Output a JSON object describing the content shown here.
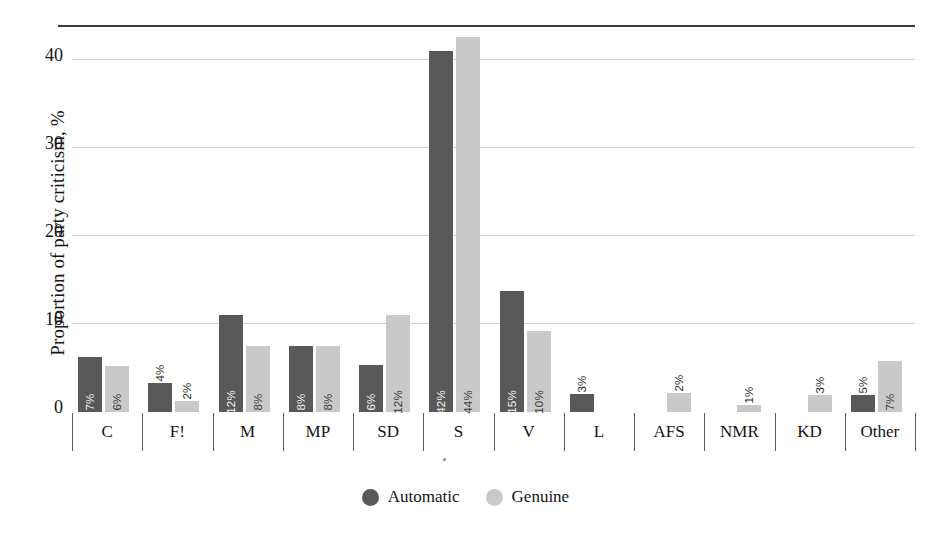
{
  "chart_data": {
    "type": "bar",
    "title": "",
    "xlabel": "",
    "ylabel": "Proportion of party criticism, %",
    "ylim": [
      0,
      44
    ],
    "yticks": [
      0,
      10,
      20,
      30,
      40
    ],
    "ytick_labels": [
      "0",
      "10",
      "20",
      "30",
      "40"
    ],
    "grid": true,
    "legend_position": "bottom-center",
    "categories": [
      "C",
      "F!",
      "M",
      "MP",
      "SD",
      "S",
      "V",
      "L",
      "AFS",
      "NMR",
      "KD",
      "Other"
    ],
    "series": [
      {
        "name": "Automatic",
        "color": "#595959",
        "values": [
          6.3,
          3.3,
          11.0,
          7.5,
          5.3,
          41.0,
          13.8,
          2.0,
          0,
          0,
          0,
          1.9
        ],
        "data_labels": [
          "7%",
          "4%",
          "12%",
          "8%",
          "6%",
          "42%",
          "15%",
          "3%",
          "",
          "",
          "",
          "5%"
        ]
      },
      {
        "name": "Genuine",
        "color": "#c9c9c9",
        "values": [
          5.2,
          1.3,
          7.5,
          7.5,
          11.0,
          42.6,
          9.2,
          0,
          2.2,
          0.8,
          1.9,
          5.8
        ],
        "data_labels": [
          "6%",
          "2%",
          "8%",
          "8%",
          "12%",
          "44%",
          "10%",
          "",
          "2%",
          "1%",
          "3%",
          "7%"
        ]
      }
    ]
  },
  "legend": {
    "items": [
      {
        "label": "Automatic",
        "color": "#595959"
      },
      {
        "label": "Genuine",
        "color": "#c9c9c9"
      }
    ]
  },
  "colors": {
    "automatic": "#595959",
    "genuine": "#c9c9c9",
    "gridline": "#cfcfcf",
    "axis": "#3b3b3b",
    "text": "#141414",
    "background": "#ffffff"
  }
}
